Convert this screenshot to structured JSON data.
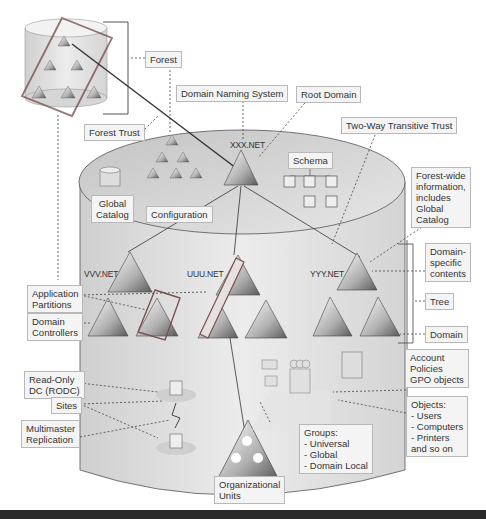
{
  "diagram": {
    "labels": {
      "forest": "Forest",
      "domain_naming_system": "Domain Naming System",
      "root_domain": "Root Domain",
      "forest_trust": "Forest Trust",
      "two_way_transitive_trust": "Two-Way Transitive Trust",
      "schema": "Schema",
      "global_catalog": "Global\nCatalog",
      "configuration": "Configuration",
      "forest_wide_info": "Forest-wide\ninformation,\nincludes\nGlobal\nCatalog",
      "domain_specific": "Domain-\nspecific\ncontents",
      "tree": "Tree",
      "domain": "Domain",
      "application_partitions": "Application\nPartitions",
      "domain_controllers": "Domain\nControllers",
      "rodc": "Read-Only\nDC (RODC)",
      "sites": "Sites",
      "multimaster_replication": "Multimaster\nReplication",
      "account_policies": "Account\nPolicies\nGPO objects",
      "objects": "Objects:\n- Users\n- Computers\n- Printers\nand so on",
      "groups": "Groups:\n- Universal\n- Global\n- Domain Local",
      "organizational_units": "Organizational\nUnits"
    },
    "domains": {
      "root": "XXX.NET",
      "vvv": "VVV.NET",
      "uuu": "UUU.NET",
      "yyy": "YYY.NET"
    }
  }
}
